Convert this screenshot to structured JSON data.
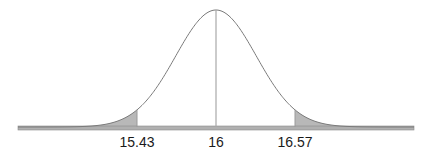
{
  "chart_data": {
    "type": "area",
    "title": "",
    "xlabel": "",
    "ylabel": "",
    "distribution": "normal",
    "mean": 16,
    "lower_critical": 15.43,
    "upper_critical": 16.57,
    "shaded_regions": [
      "x < 15.43",
      "x > 16.57"
    ],
    "tick_labels": [
      "15.43",
      "16",
      "16.57"
    ],
    "ticks": [
      15.43,
      16,
      16.57
    ],
    "grid": false,
    "legend": "none",
    "colors": {
      "curve": "#7a7a7a",
      "shade": "#b8b8b8",
      "axis": "#9a9a9a",
      "mean_line": "#a8a8a8"
    }
  },
  "labels": {
    "lower": "15.43",
    "mean": "16",
    "upper": "16.57"
  }
}
